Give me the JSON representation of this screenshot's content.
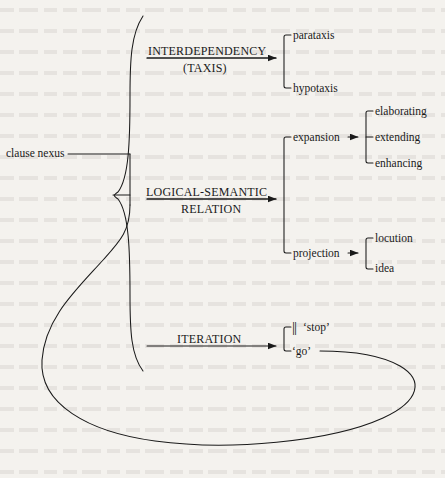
{
  "diagram": {
    "type": "tree",
    "root": {
      "label": "clause nexus"
    },
    "systems": [
      {
        "id": "interdependency",
        "label_line1": "INTERDEPENDENCY",
        "label_line2": "(TAXIS)",
        "underlined": true,
        "terms": [
          {
            "label": "parataxis"
          },
          {
            "label": "hypotaxis"
          }
        ]
      },
      {
        "id": "logical-semantic-relation",
        "label_line1": "LOGICAL-SEMANTIC",
        "label_line2": "RELATION",
        "underlined": true,
        "terms": [
          {
            "label": "expansion",
            "terms": [
              {
                "label": "elaborating"
              },
              {
                "label": "extending"
              },
              {
                "label": "enhancing"
              }
            ]
          },
          {
            "label": "projection",
            "terms": [
              {
                "label": "locution"
              },
              {
                "label": "idea"
              }
            ]
          }
        ]
      },
      {
        "id": "iteration",
        "label_line1": "ITERATION",
        "label_line2": "",
        "underlined": false,
        "terms": [
          {
            "label": "‘stop’",
            "prefix_glyph": "||"
          },
          {
            "label": "‘go’",
            "recursive": true
          }
        ]
      }
    ],
    "colors": {
      "line": "#1a1a1a",
      "text": "#1a1a1a",
      "background": "#f4f2ee"
    }
  }
}
